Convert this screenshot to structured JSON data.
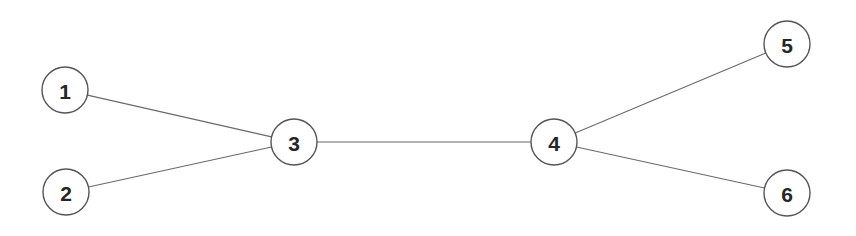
{
  "diagram": {
    "type": "node-link-graph",
    "title": "",
    "width": 856,
    "height": 236,
    "background_color": "#ffffff",
    "directed": false,
    "style": {
      "node_radius": 23,
      "node_fill": "#ffffff",
      "node_stroke_color": "#555555",
      "node_stroke_width": 1.4,
      "edge_color": "#6a6a6a",
      "edge_width": 1.1,
      "label_color": "#262626",
      "label_font_size": 21
    },
    "nodes": [
      {
        "id": "1",
        "label": "1",
        "x": 65,
        "y": 90,
        "r": 23
      },
      {
        "id": "2",
        "label": "2",
        "x": 66,
        "y": 192,
        "r": 23
      },
      {
        "id": "3",
        "label": "3",
        "x": 294,
        "y": 142,
        "r": 23
      },
      {
        "id": "4",
        "label": "4",
        "x": 554,
        "y": 142,
        "r": 23
      },
      {
        "id": "5",
        "label": "5",
        "x": 787,
        "y": 44,
        "r": 23
      },
      {
        "id": "6",
        "label": "6",
        "x": 787,
        "y": 193,
        "r": 23
      }
    ],
    "edges": [
      {
        "id": "e1",
        "source": "1",
        "target": "3",
        "label": ""
      },
      {
        "id": "e2",
        "source": "2",
        "target": "3",
        "label": ""
      },
      {
        "id": "e3",
        "source": "3",
        "target": "4",
        "label": ""
      },
      {
        "id": "e4",
        "source": "4",
        "target": "5",
        "label": ""
      },
      {
        "id": "e5",
        "source": "4",
        "target": "6",
        "label": ""
      }
    ]
  }
}
